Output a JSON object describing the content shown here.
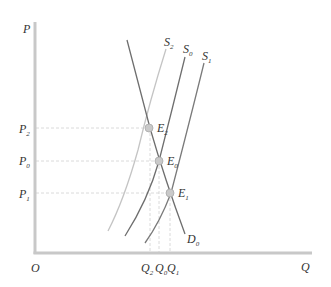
{
  "diagram": {
    "type": "supply-demand",
    "axes": {
      "y_label": "P",
      "x_label": "Q",
      "origin_label": "O",
      "axis_color": "#c8c8c8"
    },
    "curves": [
      {
        "id": "D0",
        "label": "D",
        "sub": "0",
        "color": "#6e6e6e"
      },
      {
        "id": "S2",
        "label": "S",
        "sub": "2",
        "color": "#c4c4c4"
      },
      {
        "id": "S0",
        "label": "S",
        "sub": "0",
        "color": "#6e6e6e"
      },
      {
        "id": "S1",
        "label": "S",
        "sub": "1",
        "color": "#7a7a7a"
      }
    ],
    "equilibria": [
      {
        "id": "E2",
        "label": "E",
        "sub": "2",
        "price": "P",
        "price_sub": "2",
        "qty": "Q",
        "qty_sub": "2"
      },
      {
        "id": "E0",
        "label": "E",
        "sub": "0",
        "price": "P",
        "price_sub": "0",
        "qty": "Q",
        "qty_sub": "0"
      },
      {
        "id": "E1",
        "label": "E",
        "sub": "1",
        "price": "P",
        "price_sub": "1",
        "qty": "Q",
        "qty_sub": "1"
      }
    ],
    "point_color": "#c9c9c9",
    "guide_color": "#d0d0d0"
  }
}
